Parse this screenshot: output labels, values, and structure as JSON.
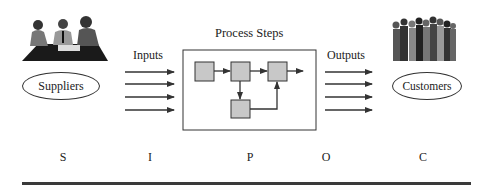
{
  "diagram": {
    "type": "SIPOC",
    "suppliers": {
      "label": "Suppliers",
      "image": "people-meeting-illustration"
    },
    "inputs": {
      "label": "Inputs",
      "arrow_count": 4
    },
    "process": {
      "label": "Process Steps",
      "steps": [
        {
          "id": "step-1",
          "row": 1,
          "col": 1
        },
        {
          "id": "step-2",
          "row": 1,
          "col": 2
        },
        {
          "id": "step-3",
          "row": 1,
          "col": 3
        },
        {
          "id": "step-4",
          "row": 2,
          "col": 2
        }
      ],
      "flows": [
        {
          "from": "step-1",
          "to": "step-2"
        },
        {
          "from": "step-2",
          "to": "step-3"
        },
        {
          "from": "step-2",
          "to": "step-4"
        },
        {
          "from": "step-4",
          "to": "step-3"
        },
        {
          "from": "step-3",
          "to": "output"
        }
      ]
    },
    "outputs": {
      "label": "Outputs",
      "arrow_count": 4
    },
    "customers": {
      "label": "Customers",
      "image": "crowd-of-people-illustration"
    },
    "letters": [
      "S",
      "I",
      "P",
      "O",
      "C"
    ]
  },
  "colors": {
    "step_fill": "#c8c8c8",
    "stroke": "#333333",
    "arrow": "#333333",
    "rule": "#3a3a3a"
  }
}
